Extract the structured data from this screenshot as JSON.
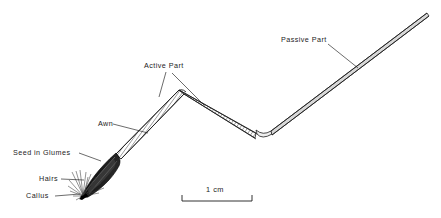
{
  "figure": {
    "background_color": "#ffffff",
    "ink_color": "#1c1c1c",
    "width": 441,
    "height": 218
  },
  "labels": {
    "passive_part": "Passive Part",
    "active_part": "Active Part",
    "awn": "Awn",
    "seed_in_glumes": "Seed in Glumes",
    "hairs": "Hairs",
    "callus": "Callus"
  },
  "scale_bar": {
    "caption": "1 cm",
    "x_start": 182,
    "x_end": 252,
    "y_baseline": 201,
    "tick_height": 6
  },
  "structure": {
    "callus_point": [
      81,
      197
    ],
    "seed_body_tip": [
      81,
      197
    ],
    "seed_body_end": [
      118,
      152
    ],
    "awn_bend_apex": [
      181,
      92
    ],
    "awn_bend_valley": [
      258,
      136
    ],
    "passive_tip": [
      428,
      14
    ]
  }
}
